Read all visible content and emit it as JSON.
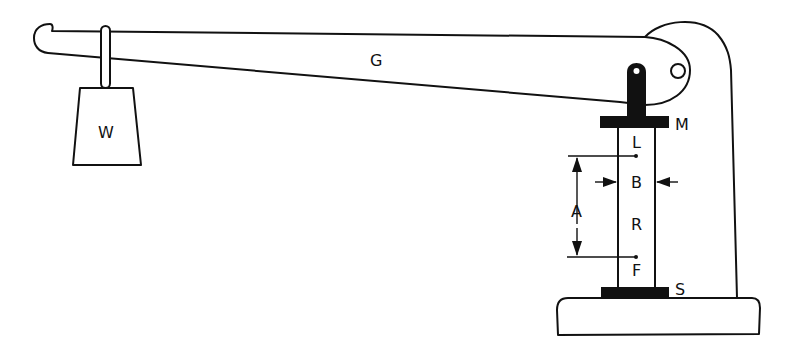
{
  "diagram": {
    "type": "lever-loading apparatus",
    "labels": {
      "weight": "W",
      "lever": "G",
      "upper_plate": "M",
      "upper_mark": "L",
      "width": "B",
      "specimen": "R",
      "gauge_length": "A",
      "lower_mark": "F",
      "lower_plate": "S"
    },
    "colors": {
      "line": "#111111",
      "background": "#ffffff",
      "fill": "#111111"
    }
  }
}
